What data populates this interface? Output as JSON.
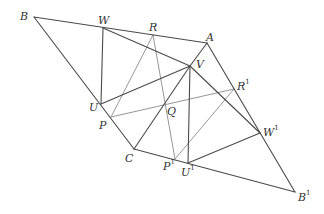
{
  "diagram": {
    "title": "",
    "points": [
      {
        "id": "B",
        "label": "B",
        "sup": "",
        "x": 34,
        "y": 17,
        "lx": 20,
        "ly": 11
      },
      {
        "id": "W",
        "label": "W",
        "sup": "",
        "x": 103,
        "y": 28,
        "lx": 98,
        "ly": 15
      },
      {
        "id": "R",
        "label": "R",
        "sup": "",
        "x": 153,
        "y": 35,
        "lx": 149,
        "ly": 22
      },
      {
        "id": "A",
        "label": "A",
        "sup": "",
        "x": 207,
        "y": 43,
        "lx": 206,
        "ly": 32
      },
      {
        "id": "V",
        "label": "V",
        "sup": "",
        "x": 190,
        "y": 66,
        "lx": 196,
        "ly": 59
      },
      {
        "id": "U",
        "label": "U",
        "sup": "",
        "x": 101,
        "y": 104,
        "lx": 89,
        "ly": 102
      },
      {
        "id": "P",
        "label": "P",
        "sup": "",
        "x": 111,
        "y": 117,
        "lx": 99,
        "ly": 120
      },
      {
        "id": "Q",
        "label": "Q",
        "sup": "",
        "x": 165,
        "y": 104,
        "lx": 167,
        "ly": 106
      },
      {
        "id": "R1",
        "label": "R",
        "sup": "1",
        "x": 234,
        "y": 89,
        "lx": 237,
        "ly": 81
      },
      {
        "id": "C",
        "label": "C",
        "sup": "",
        "x": 134,
        "y": 149,
        "lx": 125,
        "ly": 153
      },
      {
        "id": "P1",
        "label": "P",
        "sup": "1",
        "x": 175,
        "y": 159,
        "lx": 163,
        "ly": 161
      },
      {
        "id": "U1",
        "label": "U",
        "sup": "1",
        "x": 188,
        "y": 163,
        "lx": 181,
        "ly": 167
      },
      {
        "id": "W1",
        "label": "W",
        "sup": "1",
        "x": 260,
        "y": 133,
        "lx": 263,
        "ly": 127
      },
      {
        "id": "B1",
        "label": "B",
        "sup": "1",
        "x": 295,
        "y": 192,
        "lx": 298,
        "ly": 192
      }
    ],
    "segments_dark": [
      [
        "B",
        "A"
      ],
      [
        "B",
        "C"
      ],
      [
        "C",
        "B1"
      ],
      [
        "A",
        "B1"
      ],
      [
        "W",
        "U"
      ],
      [
        "W",
        "V"
      ],
      [
        "U",
        "V"
      ],
      [
        "A",
        "V"
      ],
      [
        "V",
        "C"
      ],
      [
        "V",
        "U1"
      ],
      [
        "V",
        "W1"
      ],
      [
        "U1",
        "W1"
      ]
    ],
    "segments_light": [
      [
        "R",
        "P"
      ],
      [
        "R",
        "P1"
      ],
      [
        "P",
        "R1"
      ],
      [
        "P1",
        "R1"
      ]
    ],
    "colors": {
      "dark": "#4a4a4a",
      "light": "#8a8a8a",
      "label": "#333333"
    }
  }
}
